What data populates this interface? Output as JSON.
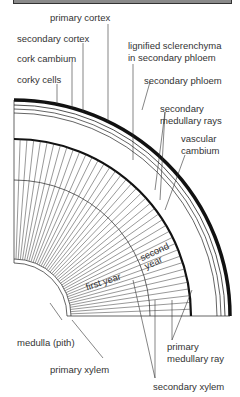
{
  "diagram": {
    "labels": {
      "primary_cortex": "primary cortex",
      "secondary_cortex": "secondary cortex",
      "cork_cambium": "cork cambium",
      "corky_cells": "corky cells",
      "lignified_1": "lignified sclerenchyma",
      "lignified_2": "in secondary phloem",
      "secondary_phloem": "secondary phloem",
      "sec_med_rays_1": "secondary",
      "sec_med_rays_2": "medullary rays",
      "vascular_cambium_1": "vascular",
      "vascular_cambium_2": "cambium",
      "second_year_1": "second",
      "second_year_2": "year",
      "first_year": "first year",
      "medulla": "medulla (pith)",
      "primary_xylem": "primary xylem",
      "primary_med_ray_1": "primary",
      "primary_med_ray_2": "medullary ray",
      "secondary_xylem": "secondary xylem"
    }
  }
}
